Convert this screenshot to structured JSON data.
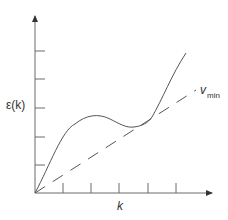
{
  "diagram": {
    "type": "energy-dispersion-plot",
    "y_axis": {
      "label": "ε(k)",
      "tick_count": 5
    },
    "x_axis": {
      "label": "k",
      "tick_count": 5
    },
    "curves": [
      {
        "name": "dispersion-curve",
        "label": "ε(k)",
        "style": "solid",
        "shape": "rises from origin, local maximum, local minimum, then rises steeply"
      },
      {
        "name": "tangent-line",
        "label_main": "v",
        "label_sub": "min",
        "style": "dashed",
        "shape": "straight line from origin tangent to curve after the local minimum"
      }
    ]
  },
  "labels": {
    "y_axis": "ε(k)",
    "x_axis": "k",
    "line_main": "v",
    "line_sub": "min"
  },
  "colors": {
    "axis": "#6a6a6a",
    "curve": "#555555",
    "text": "#333333",
    "background": "#ffffff"
  }
}
